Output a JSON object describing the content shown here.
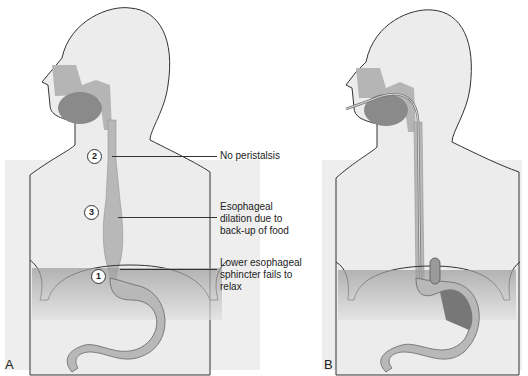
{
  "figure": {
    "panels": [
      {
        "id": "A",
        "letter": "A",
        "markers": [
          {
            "number": "2",
            "label": "No peristalsis"
          },
          {
            "number": "3",
            "label": "Esophageal dilation due to back-up of food"
          },
          {
            "number": "1",
            "label": "Lower esophageal sphincter fails to relax"
          }
        ],
        "labels": {
          "no_peristalsis": "No peristalsis",
          "dilation_l1": "Esophageal",
          "dilation_l2": "dilation due to",
          "dilation_l3": "back-up of food",
          "sphincter_l1": "Lower esophageal",
          "sphincter_l2": "sphincter fails to",
          "sphincter_l3": "relax"
        }
      },
      {
        "id": "B",
        "letter": "B",
        "description": "Tube inserted through mouth down esophagus into stomach"
      }
    ],
    "colors": {
      "skin": "#ececec",
      "organ": "#b5b5b5",
      "organ_dark": "#8a8a8a",
      "outline": "#333333",
      "text": "#222222"
    }
  }
}
